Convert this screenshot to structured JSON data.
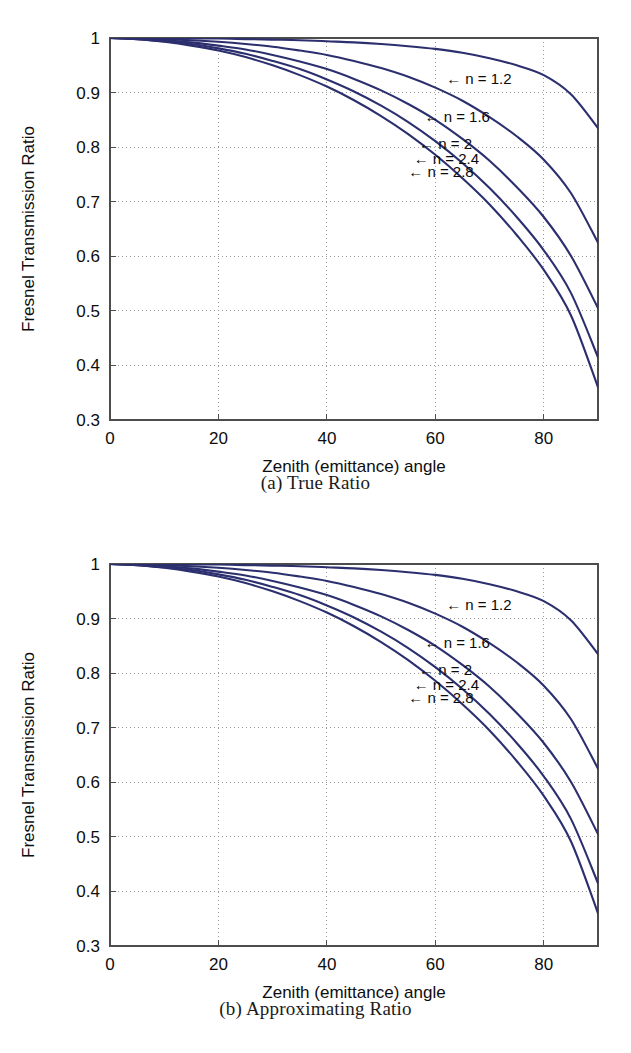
{
  "figure": {
    "panels": [
      {
        "id": "panel-a",
        "caption": "(a)  True Ratio"
      },
      {
        "id": "panel-b",
        "caption": "(b)  Approximating Ratio"
      }
    ]
  },
  "chart_data": [
    {
      "type": "line",
      "title": "",
      "subtitle": "(a) True Ratio",
      "xlabel": "Zenith (emittance) angle",
      "ylabel": "Fresnel Transmission Ratio",
      "xlim": [
        0,
        90
      ],
      "ylim": [
        0.3,
        1
      ],
      "xticks": [
        0,
        20,
        40,
        60,
        80
      ],
      "xtick_labels": [
        "0",
        "20",
        "40",
        "60",
        "80"
      ],
      "yticks": [
        0.3,
        0.4,
        0.5,
        0.6,
        0.7,
        0.8,
        0.9,
        1
      ],
      "ytick_labels": [
        "0.3",
        "0.4",
        "0.5",
        "0.6",
        "0.7",
        "0.8",
        "0.9",
        "1"
      ],
      "grid": true,
      "legend": "none",
      "line_color": "#2b2f6e",
      "x": [
        0,
        5,
        10,
        15,
        20,
        25,
        30,
        35,
        40,
        45,
        50,
        55,
        60,
        65,
        70,
        75,
        80,
        85,
        90
      ],
      "series": [
        {
          "name": "n = 1.2",
          "annotation": "← n = 1.2",
          "annotation_x": 62,
          "annotation_y": 0.925,
          "values": [
            1,
            1,
            1,
            0.999,
            0.999,
            0.998,
            0.997,
            0.996,
            0.994,
            0.992,
            0.989,
            0.985,
            0.98,
            0.973,
            0.963,
            0.95,
            0.932,
            0.897,
            0.835
          ]
        },
        {
          "name": "n = 1.6",
          "annotation": "← n = 1.6",
          "annotation_x": 58,
          "annotation_y": 0.855,
          "values": [
            1,
            0.999,
            0.998,
            0.996,
            0.993,
            0.989,
            0.984,
            0.977,
            0.969,
            0.958,
            0.945,
            0.929,
            0.909,
            0.885,
            0.855,
            0.82,
            0.777,
            0.716,
            0.625
          ]
        },
        {
          "name": "n = 2",
          "annotation": "← n = 2",
          "annotation_x": 57,
          "annotation_y": 0.805,
          "values": [
            1,
            0.999,
            0.996,
            0.992,
            0.986,
            0.979,
            0.969,
            0.957,
            0.943,
            0.925,
            0.904,
            0.879,
            0.85,
            0.815,
            0.775,
            0.727,
            0.672,
            0.601,
            0.505
          ]
        },
        {
          "name": "n = 2.4",
          "annotation": "← n = 2.4",
          "annotation_x": 56,
          "annotation_y": 0.779,
          "values": [
            1,
            0.998,
            0.994,
            0.989,
            0.981,
            0.971,
            0.958,
            0.943,
            0.924,
            0.902,
            0.876,
            0.846,
            0.811,
            0.771,
            0.725,
            0.672,
            0.611,
            0.533,
            0.415
          ]
        },
        {
          "name": "n = 2.8",
          "annotation": "← n = 2.8",
          "annotation_x": 55,
          "annotation_y": 0.754,
          "values": [
            1,
            0.998,
            0.993,
            0.986,
            0.977,
            0.965,
            0.95,
            0.932,
            0.911,
            0.886,
            0.857,
            0.824,
            0.786,
            0.743,
            0.695,
            0.639,
            0.575,
            0.492,
            0.36
          ]
        }
      ]
    },
    {
      "type": "line",
      "title": "",
      "subtitle": "(b) Approximating Ratio",
      "xlabel": "Zenith (emittance) angle",
      "ylabel": "Fresnel Transmission Ratio",
      "xlim": [
        0,
        90
      ],
      "ylim": [
        0.3,
        1
      ],
      "xticks": [
        0,
        20,
        40,
        60,
        80
      ],
      "xtick_labels": [
        "0",
        "20",
        "40",
        "60",
        "80"
      ],
      "yticks": [
        0.3,
        0.4,
        0.5,
        0.6,
        0.7,
        0.8,
        0.9,
        1
      ],
      "ytick_labels": [
        "0.3",
        "0.4",
        "0.5",
        "0.6",
        "0.7",
        "0.8",
        "0.9",
        "1"
      ],
      "grid": true,
      "legend": "none",
      "line_color": "#2b2f6e",
      "x": [
        0,
        5,
        10,
        15,
        20,
        25,
        30,
        35,
        40,
        45,
        50,
        55,
        60,
        65,
        70,
        75,
        80,
        85,
        90
      ],
      "series": [
        {
          "name": "n = 1.2",
          "annotation": "← n = 1.2",
          "annotation_x": 62,
          "annotation_y": 0.925,
          "values": [
            1,
            1,
            1,
            0.999,
            0.999,
            0.998,
            0.997,
            0.996,
            0.994,
            0.992,
            0.989,
            0.985,
            0.98,
            0.973,
            0.963,
            0.95,
            0.932,
            0.897,
            0.835
          ]
        },
        {
          "name": "n = 1.6",
          "annotation": "← n = 1.6",
          "annotation_x": 58,
          "annotation_y": 0.855,
          "values": [
            1,
            0.999,
            0.998,
            0.996,
            0.993,
            0.989,
            0.984,
            0.977,
            0.969,
            0.958,
            0.945,
            0.929,
            0.909,
            0.885,
            0.855,
            0.82,
            0.777,
            0.716,
            0.625
          ]
        },
        {
          "name": "n = 2",
          "annotation": "← n = 2",
          "annotation_x": 57,
          "annotation_y": 0.805,
          "values": [
            1,
            0.999,
            0.996,
            0.992,
            0.986,
            0.979,
            0.969,
            0.957,
            0.943,
            0.925,
            0.904,
            0.879,
            0.85,
            0.815,
            0.775,
            0.727,
            0.672,
            0.601,
            0.505
          ]
        },
        {
          "name": "n = 2.4",
          "annotation": "← n = 2.4",
          "annotation_x": 56,
          "annotation_y": 0.779,
          "values": [
            1,
            0.998,
            0.994,
            0.989,
            0.981,
            0.971,
            0.958,
            0.943,
            0.924,
            0.902,
            0.876,
            0.846,
            0.811,
            0.771,
            0.725,
            0.672,
            0.611,
            0.533,
            0.415
          ]
        },
        {
          "name": "n = 2.8",
          "annotation": "← n = 2.8",
          "annotation_x": 55,
          "annotation_y": 0.754,
          "values": [
            1,
            0.998,
            0.993,
            0.986,
            0.977,
            0.965,
            0.95,
            0.932,
            0.911,
            0.886,
            0.857,
            0.824,
            0.786,
            0.743,
            0.695,
            0.639,
            0.575,
            0.492,
            0.36
          ]
        }
      ]
    }
  ]
}
